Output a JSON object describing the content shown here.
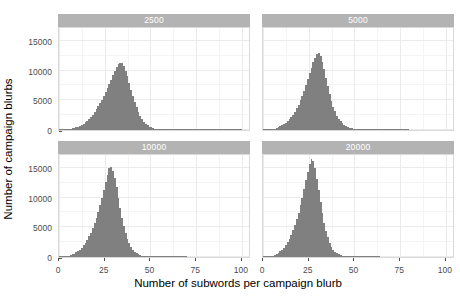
{
  "chart_data": {
    "type": "bar",
    "title": "",
    "subtitle": "",
    "xlabel": "Number of subwords per campaign blurb",
    "ylabel": "Number of campaign blurbs",
    "xlim": [
      0,
      105
    ],
    "ylim": [
      0,
      17500
    ],
    "xticks": [
      0,
      25,
      50,
      75,
      100
    ],
    "yticks": [
      0,
      5000,
      10000,
      15000
    ],
    "xtick_labels": [
      "0",
      "25",
      "50",
      "75",
      "100"
    ],
    "ytick_labels": [
      "0",
      "5000",
      "10000",
      "15000"
    ],
    "grid": true,
    "legend": "none",
    "facet_layout": "2x2",
    "facet_variable": "vocabulary size",
    "bin_width": 1,
    "bar_color": "#808080",
    "strip_color": "#b3b3b3",
    "strip_text_color": "#ffffff",
    "panel_background": "#ffffff",
    "gridline_color": "#ebebeb",
    "panels": [
      {
        "strip_label": "2500",
        "peak_x": 33,
        "peak_y": 11300,
        "x": [
          0,
          1,
          2,
          3,
          4,
          5,
          6,
          7,
          8,
          9,
          10,
          11,
          12,
          13,
          14,
          15,
          16,
          17,
          18,
          19,
          20,
          21,
          22,
          23,
          24,
          25,
          26,
          27,
          28,
          29,
          30,
          31,
          32,
          33,
          34,
          35,
          36,
          37,
          38,
          39,
          40,
          41,
          42,
          43,
          44,
          45,
          46,
          47,
          48,
          49,
          50,
          51,
          52,
          53,
          54,
          55,
          56,
          57,
          58,
          59,
          60,
          62,
          64,
          66,
          68,
          70,
          75,
          80,
          85,
          90,
          95,
          100
        ],
        "values": [
          10,
          20,
          35,
          60,
          90,
          130,
          190,
          260,
          340,
          440,
          560,
          700,
          870,
          1070,
          1300,
          1560,
          1860,
          2200,
          2580,
          3000,
          3460,
          3960,
          4500,
          5080,
          5700,
          6350,
          7030,
          7740,
          8470,
          9200,
          9900,
          10550,
          11050,
          11300,
          11200,
          10750,
          10000,
          9050,
          7950,
          6800,
          5700,
          4700,
          3800,
          3020,
          2360,
          1820,
          1380,
          1040,
          780,
          580,
          430,
          320,
          240,
          180,
          140,
          110,
          85,
          68,
          54,
          44,
          36,
          25,
          18,
          13,
          10,
          8,
          5,
          3,
          2,
          1,
          1,
          0
        ]
      },
      {
        "strip_label": "5000",
        "peak_x": 29,
        "peak_y": 13000,
        "x": [
          0,
          1,
          2,
          3,
          4,
          5,
          6,
          7,
          8,
          9,
          10,
          11,
          12,
          13,
          14,
          15,
          16,
          17,
          18,
          19,
          20,
          21,
          22,
          23,
          24,
          25,
          26,
          27,
          28,
          29,
          30,
          31,
          32,
          33,
          34,
          35,
          36,
          37,
          38,
          39,
          40,
          41,
          42,
          43,
          44,
          45,
          46,
          47,
          48,
          49,
          50,
          51,
          52,
          53,
          54,
          55,
          56,
          57,
          58,
          59,
          60,
          62,
          64,
          66,
          68,
          70,
          75,
          80,
          85,
          90,
          95,
          100
        ],
        "values": [
          12,
          25,
          45,
          75,
          115,
          170,
          245,
          340,
          455,
          595,
          765,
          970,
          1210,
          1490,
          1810,
          2180,
          2610,
          3100,
          3650,
          4280,
          4980,
          5760,
          6620,
          7550,
          8530,
          9530,
          10500,
          11400,
          12200,
          12850,
          13000,
          12500,
          11500,
          10200,
          8800,
          7400,
          6100,
          4950,
          3950,
          3120,
          2440,
          1890,
          1450,
          1110,
          840,
          630,
          470,
          350,
          260,
          195,
          145,
          108,
          80,
          60,
          45,
          34,
          26,
          20,
          15,
          12,
          9,
          6,
          4,
          3,
          2,
          1,
          1,
          0,
          0,
          0,
          0,
          0
        ]
      },
      {
        "strip_label": "10000",
        "peak_x": 27,
        "peak_y": 15100,
        "x": [
          0,
          1,
          2,
          3,
          4,
          5,
          6,
          7,
          8,
          9,
          10,
          11,
          12,
          13,
          14,
          15,
          16,
          17,
          18,
          19,
          20,
          21,
          22,
          23,
          24,
          25,
          26,
          27,
          28,
          29,
          30,
          31,
          32,
          33,
          34,
          35,
          36,
          37,
          38,
          39,
          40,
          41,
          42,
          43,
          44,
          45,
          46,
          47,
          48,
          49,
          50,
          51,
          52,
          53,
          54,
          55,
          56,
          57,
          58,
          59,
          60,
          62,
          64,
          66,
          68,
          70,
          75,
          80,
          85,
          90,
          95,
          100
        ],
        "values": [
          14,
          30,
          55,
          90,
          140,
          210,
          305,
          425,
          575,
          760,
          985,
          1255,
          1575,
          1950,
          2385,
          2885,
          3455,
          4105,
          4840,
          5670,
          6600,
          7630,
          8760,
          9980,
          11270,
          12580,
          13850,
          14950,
          15100,
          14550,
          13300,
          11700,
          9950,
          8200,
          6600,
          5200,
          4020,
          3050,
          2280,
          1680,
          1230,
          900,
          660,
          480,
          350,
          255,
          185,
          135,
          100,
          73,
          54,
          40,
          29,
          22,
          16,
          12,
          9,
          7,
          5,
          4,
          3,
          2,
          1,
          1,
          1,
          0,
          0,
          0,
          0,
          0,
          0,
          0
        ]
      },
      {
        "strip_label": "20000",
        "peak_x": 26,
        "peak_y": 16500,
        "x": [
          0,
          1,
          2,
          3,
          4,
          5,
          6,
          7,
          8,
          9,
          10,
          11,
          12,
          13,
          14,
          15,
          16,
          17,
          18,
          19,
          20,
          21,
          22,
          23,
          24,
          25,
          26,
          27,
          28,
          29,
          30,
          31,
          32,
          33,
          34,
          35,
          36,
          37,
          38,
          39,
          40,
          41,
          42,
          43,
          44,
          45,
          46,
          47,
          48,
          49,
          50,
          51,
          52,
          53,
          54,
          55,
          56,
          57,
          58,
          59,
          60,
          62,
          64,
          66,
          68,
          70,
          75,
          80,
          85,
          90,
          95,
          100
        ],
        "values": [
          16,
          35,
          62,
          105,
          165,
          250,
          365,
          515,
          705,
          940,
          1225,
          1570,
          1985,
          2475,
          3050,
          3715,
          4480,
          5355,
          6340,
          7450,
          8670,
          10000,
          11420,
          12900,
          14350,
          15700,
          16500,
          16200,
          15000,
          13200,
          11200,
          9200,
          7350,
          5750,
          4400,
          3300,
          2430,
          1760,
          1250,
          880,
          615,
          425,
          295,
          205,
          142,
          100,
          70,
          50,
          35,
          25,
          18,
          13,
          9,
          7,
          5,
          4,
          3,
          2,
          2,
          1,
          1,
          1,
          0,
          0,
          0,
          0,
          0,
          0,
          0,
          0,
          0,
          0
        ]
      }
    ]
  },
  "axes": {
    "y_title": "Number of campaign blurbs",
    "x_title": "Number of subwords per campaign blurb"
  }
}
